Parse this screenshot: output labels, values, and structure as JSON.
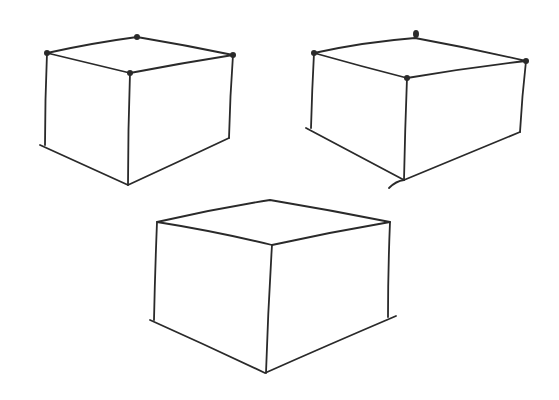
{
  "canvas": {
    "width": 559,
    "height": 400,
    "background": "#ffffff",
    "ink": "#2a2a2a"
  },
  "boxes": [
    {
      "name": "top-left-box",
      "top": [
        [
          47,
          53
        ],
        [
          137,
          37
        ],
        [
          233,
          55
        ],
        [
          130,
          73
        ]
      ],
      "bottom": {
        "left": [
          45,
          145
        ],
        "front": [
          128,
          185
        ],
        "right": [
          228,
          138
        ]
      },
      "dots": [
        [
          47,
          53
        ],
        [
          137,
          37
        ],
        [
          233,
          55
        ],
        [
          130,
          73
        ]
      ]
    },
    {
      "name": "top-right-box",
      "top": [
        [
          314,
          53
        ],
        [
          415,
          37
        ],
        [
          526,
          61
        ],
        [
          407,
          78
        ]
      ],
      "bottom": {
        "left": [
          311,
          128
        ],
        "front": [
          404,
          180
        ],
        "right": [
          520,
          132
        ]
      },
      "dots": [
        [
          314,
          53
        ],
        [
          415,
          34
        ],
        [
          526,
          61
        ],
        [
          407,
          78
        ]
      ]
    },
    {
      "name": "bottom-center-box",
      "top": [
        [
          157,
          222
        ],
        [
          270,
          200
        ],
        [
          390,
          222
        ],
        [
          272,
          245
        ]
      ],
      "bottom": {
        "left": [
          154,
          320
        ],
        "front": [
          265,
          373
        ],
        "right": [
          388,
          317
        ]
      },
      "dots": []
    }
  ]
}
